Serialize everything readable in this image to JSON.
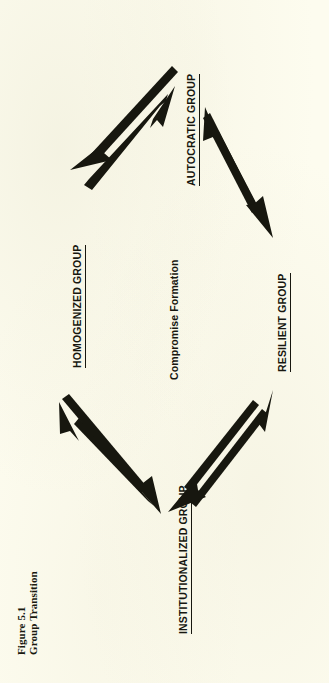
{
  "figure": {
    "caption_label": "Figure 5.1",
    "caption_title": "Group Transition",
    "orientation": "rotated-90-ccw",
    "ink_color": "#17170f",
    "paper_color": "#fdfcef"
  },
  "nodes": [
    {
      "id": "autocratic",
      "label": "AUTOCRATIC GROUP",
      "underlined": true,
      "position": "top"
    },
    {
      "id": "homogenized",
      "label": "HOMOGENIZED GROUP",
      "underlined": true,
      "position": "left"
    },
    {
      "id": "resilient",
      "label": "RESILIENT GROUP",
      "underlined": true,
      "position": "right"
    },
    {
      "id": "institutionalized",
      "label": "INSTITUTIONALIZED GROUP",
      "underlined": true,
      "position": "bottom"
    }
  ],
  "center": {
    "label": "Compromise Formation",
    "underlined": false
  },
  "edges": [
    {
      "id": "homogenized-autocratic",
      "from": "HOMOGENIZED GROUP",
      "to": "AUTOCRATIC GROUP",
      "bidirectional": true
    },
    {
      "id": "autocratic-resilient",
      "from": "AUTOCRATIC GROUP",
      "to": "RESILIENT GROUP",
      "bidirectional": true
    },
    {
      "id": "resilient-institutionalized",
      "from": "RESILIENT GROUP",
      "to": "INSTITUTIONALIZED GROUP",
      "bidirectional": true
    },
    {
      "id": "institutionalized-homogenized",
      "from": "INSTITUTIONALIZED GROUP",
      "to": "HOMOGENIZED GROUP",
      "bidirectional": true
    }
  ]
}
